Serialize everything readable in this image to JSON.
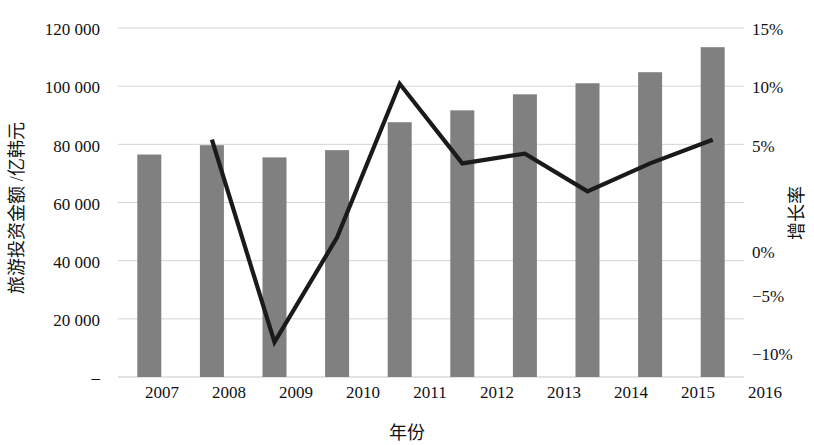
{
  "chart_data": {
    "type": "bar",
    "title": "",
    "subtitle": "",
    "xlabel": "年份",
    "ylabel": "旅游投资金额 /亿韩元",
    "y2label": "增长率",
    "categories": [
      "2007",
      "2008",
      "2009",
      "2010",
      "2011",
      "2012",
      "2013",
      "2014",
      "2015",
      "2016"
    ],
    "series": [
      {
        "name": "旅游投资金额 /亿韩元",
        "type": "bar",
        "axis": "left",
        "color": "#808080",
        "values": [
          76500,
          79700,
          75500,
          78000,
          87600,
          91700,
          97200,
          101000,
          104800,
          113400
        ]
      },
      {
        "name": "增长率",
        "type": "line",
        "axis": "right",
        "color": "#1a1a1a",
        "values": [
          null,
          7.0,
          -7.5,
          0.0,
          11.0,
          5.3,
          6.0,
          3.3,
          5.3,
          7.0
        ]
      }
    ],
    "ylim": [
      0,
      120000
    ],
    "yticks": [
      0,
      20000,
      40000,
      60000,
      80000,
      100000,
      120000
    ],
    "ytick_labels": [
      "–",
      "20 000",
      "40 000",
      "60 000",
      "80 000",
      "100 000",
      "120 000"
    ],
    "y2lim": [
      -10,
      15
    ],
    "y2ticks": [
      -10,
      -5,
      0,
      5,
      10,
      15
    ],
    "y2tick_labels": [
      "−10%",
      "−5%",
      "0%",
      "5%",
      "10%",
      "15%"
    ],
    "grid": true,
    "grid_color": "#c8c8c8",
    "legend": "none",
    "background": "#ffffff"
  },
  "axes": {
    "left_title": "旅游投资金额 /亿韩元",
    "right_title": "增长率",
    "bottom_title": "年份"
  }
}
